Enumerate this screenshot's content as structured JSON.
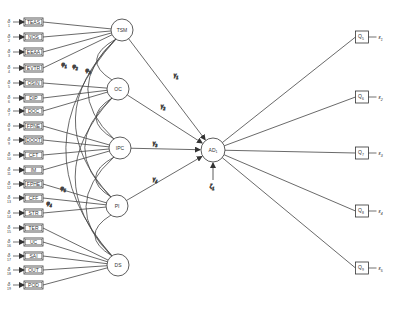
{
  "diagram": {
    "type": "structural-equation-model",
    "colors": {
      "stroke": "#333333",
      "background": "#ffffff",
      "text": "#333333"
    },
    "indicators": [
      {
        "label": "TEAS",
        "error": "δ",
        "error_sub": "1",
        "y": 22,
        "loads_on": "TSM"
      },
      {
        "label": "NOS",
        "error": "δ",
        "error_sub": "2",
        "y": 37,
        "loads_on": "TSM"
      },
      {
        "label": "EEAA",
        "error": "δ",
        "error_sub": "3",
        "y": 52,
        "loads_on": "TSM"
      },
      {
        "label": "EVTR",
        "error": "δ",
        "error_sub": "4",
        "y": 68,
        "loads_on": "TSM"
      },
      {
        "label": "OSIN",
        "error": "δ",
        "error_sub": "5",
        "y": 83,
        "loads_on": "OC"
      },
      {
        "label": "DIP",
        "error": "δ",
        "error_sub": "6",
        "y": 98,
        "loads_on": "OC"
      },
      {
        "label": "DOC",
        "error": "δ",
        "error_sub": "7",
        "y": 111,
        "loads_on": "OC"
      },
      {
        "label": "FPNE",
        "error": "δ",
        "error_sub": "8",
        "y": 126,
        "loads_on": "IPC"
      },
      {
        "label": "DOOT",
        "error": "δ",
        "error_sub": "9",
        "y": 140,
        "loads_on": "IPC"
      },
      {
        "label": "CFT",
        "error": "δ",
        "error_sub": "10",
        "y": 155,
        "loads_on": "IPC"
      },
      {
        "label": "IM",
        "error": "δ",
        "error_sub": "11",
        "y": 170,
        "loads_on": "IPC"
      },
      {
        "label": "FPHE",
        "error": "δ",
        "error_sub": "12",
        "y": 184,
        "loads_on": "PI"
      },
      {
        "label": "CFF",
        "error": "δ",
        "error_sub": "13",
        "y": 198,
        "loads_on": "PI"
      },
      {
        "label": "STR",
        "error": "δ",
        "error_sub": "14",
        "y": 213,
        "loads_on": "PI"
      },
      {
        "label": "TER",
        "error": "δ",
        "error_sub": "15",
        "y": 228,
        "loads_on": "DS"
      },
      {
        "label": "UC",
        "error": "δ",
        "error_sub": "16",
        "y": 242,
        "loads_on": "DS"
      },
      {
        "label": "SAI",
        "error": "δ",
        "error_sub": "17",
        "y": 256,
        "loads_on": "DS"
      },
      {
        "label": "OUT",
        "error": "δ",
        "error_sub": "18",
        "y": 270,
        "loads_on": "DS"
      },
      {
        "label": "POD",
        "error": "δ",
        "error_sub": "19",
        "y": 285,
        "loads_on": "DS"
      }
    ],
    "exogenous_latents": [
      {
        "label": "TSM",
        "x": 122,
        "y": 30
      },
      {
        "label": "OC",
        "x": 118,
        "y": 89
      },
      {
        "label": "IPC",
        "x": 120,
        "y": 148
      },
      {
        "label": "PI",
        "x": 117,
        "y": 206
      },
      {
        "label": "DS",
        "x": 118,
        "y": 265
      }
    ],
    "endogenous_latent": {
      "label": "AD",
      "sub": "1",
      "x": 213,
      "y": 150
    },
    "disturbance": {
      "label": "ζ",
      "sub": "1"
    },
    "structural_paths": [
      {
        "from": "TSM",
        "to": "AD",
        "coef": "γ",
        "coef_sub": "1"
      },
      {
        "from": "OC",
        "to": "AD",
        "coef": "γ",
        "coef_sub": "2"
      },
      {
        "from": "IPC",
        "to": "AD",
        "coef": "γ",
        "coef_sub": "3"
      },
      {
        "from": "PI",
        "to": "AD",
        "coef": "γ",
        "coef_sub": "4"
      }
    ],
    "covariance_labels": [
      {
        "label": "φ",
        "sub": "1"
      },
      {
        "label": "φ",
        "sub": "2"
      },
      {
        "label": "φ",
        "sub": "3"
      },
      {
        "label": "φ",
        "sub": "4"
      },
      {
        "label": "φ",
        "sub": "5"
      }
    ],
    "outcome_indicators": [
      {
        "label": "Q",
        "sub": "5",
        "error": "ε",
        "error_sub": "1",
        "x": 362,
        "y": 37
      },
      {
        "label": "Q",
        "sub": "6",
        "error": "ε",
        "error_sub": "2",
        "x": 362,
        "y": 97
      },
      {
        "label": "Q",
        "sub": "7",
        "error": "ε",
        "error_sub": "3",
        "x": 362,
        "y": 153
      },
      {
        "label": "Q",
        "sub": "8",
        "error": "ε",
        "error_sub": "4",
        "x": 362,
        "y": 211
      },
      {
        "label": "Q",
        "sub": "9",
        "error": "ε",
        "error_sub": "5",
        "x": 362,
        "y": 268
      }
    ]
  }
}
